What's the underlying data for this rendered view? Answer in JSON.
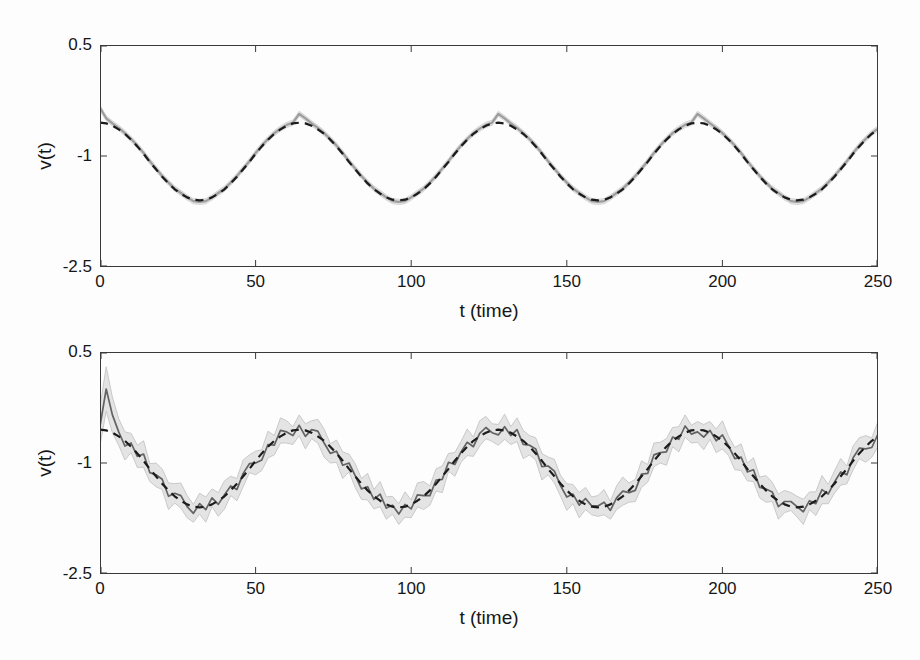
{
  "figure": {
    "background": "#fdfdfd",
    "axis_color": "#3a3a3a"
  },
  "chart_data": [
    {
      "type": "line",
      "name": "top-panel",
      "title": "",
      "xlabel": "t (time)",
      "ylabel": "v(t)",
      "xlim": [
        0,
        250
      ],
      "ylim": [
        -2.5,
        0.5
      ],
      "x_ticks": [
        0,
        50,
        100,
        150,
        200,
        250
      ],
      "x_tick_labels": [
        "0",
        "50",
        "100",
        "150",
        "200",
        "250"
      ],
      "y_ticks": [
        0.5,
        -1,
        -2.5
      ],
      "y_tick_labels": [
        "0.5",
        "-1",
        "-2.5"
      ],
      "grid": false,
      "legend": "none",
      "x_start": 0,
      "x_step": 2,
      "band": {
        "halfwidth": 0.035,
        "fill": "#e2e2e2",
        "edge": "#d6d6d6"
      },
      "series": [
        {
          "name": "filter_estimate",
          "role": "estimate",
          "style": "solid",
          "color": "#9d9d9d",
          "width": 2.2,
          "values": [
            -0.35,
            -0.49,
            -0.56,
            -0.62,
            -0.69,
            -0.77,
            -0.86,
            -0.96,
            -1.07,
            -1.17,
            -1.27,
            -1.36,
            -1.44,
            -1.5,
            -1.56,
            -1.61,
            -1.62,
            -1.61,
            -1.56,
            -1.5,
            -1.44,
            -1.36,
            -1.27,
            -1.17,
            -1.07,
            -0.96,
            -0.86,
            -0.77,
            -0.69,
            -0.63,
            -0.58,
            -0.55,
            -0.43,
            -0.49,
            -0.56,
            -0.62,
            -0.69,
            -0.77,
            -0.86,
            -0.96,
            -1.07,
            -1.17,
            -1.27,
            -1.36,
            -1.44,
            -1.5,
            -1.56,
            -1.61,
            -1.62,
            -1.61,
            -1.56,
            -1.5,
            -1.44,
            -1.36,
            -1.27,
            -1.17,
            -1.07,
            -0.96,
            -0.86,
            -0.77,
            -0.69,
            -0.63,
            -0.58,
            -0.55,
            -0.43,
            -0.49,
            -0.56,
            -0.62,
            -0.69,
            -0.77,
            -0.86,
            -0.96,
            -1.07,
            -1.17,
            -1.27,
            -1.36,
            -1.44,
            -1.5,
            -1.56,
            -1.61,
            -1.62,
            -1.61,
            -1.56,
            -1.5,
            -1.44,
            -1.36,
            -1.27,
            -1.17,
            -1.07,
            -0.96,
            -0.86,
            -0.77,
            -0.69,
            -0.63,
            -0.58,
            -0.55,
            -0.43,
            -0.49,
            -0.56,
            -0.62,
            -0.69,
            -0.77,
            -0.86,
            -0.96,
            -1.07,
            -1.17,
            -1.27,
            -1.36,
            -1.44,
            -1.5,
            -1.56,
            -1.61,
            -1.62,
            -1.61,
            -1.56,
            -1.5,
            -1.44,
            -1.36,
            -1.27,
            -1.17,
            -1.07,
            -0.96,
            -0.86,
            -0.77,
            -0.69,
            -0.63
          ]
        },
        {
          "name": "true_signal",
          "role": "truth",
          "style": "dashed",
          "color": "#1b1b1b",
          "width": 2.2,
          "dash": "8 6",
          "values": [
            -0.55,
            -0.56,
            -0.59,
            -0.64,
            -0.7,
            -0.78,
            -0.87,
            -0.97,
            -1.08,
            -1.18,
            -1.28,
            -1.37,
            -1.45,
            -1.51,
            -1.56,
            -1.59,
            -1.6,
            -1.59,
            -1.56,
            -1.51,
            -1.45,
            -1.37,
            -1.28,
            -1.18,
            -1.08,
            -0.97,
            -0.87,
            -0.78,
            -0.7,
            -0.64,
            -0.59,
            -0.56,
            -0.55,
            -0.56,
            -0.59,
            -0.64,
            -0.7,
            -0.78,
            -0.87,
            -0.97,
            -1.08,
            -1.18,
            -1.28,
            -1.37,
            -1.45,
            -1.51,
            -1.56,
            -1.59,
            -1.6,
            -1.59,
            -1.56,
            -1.51,
            -1.45,
            -1.37,
            -1.28,
            -1.18,
            -1.08,
            -0.97,
            -0.87,
            -0.78,
            -0.7,
            -0.64,
            -0.59,
            -0.56,
            -0.55,
            -0.56,
            -0.59,
            -0.64,
            -0.7,
            -0.78,
            -0.87,
            -0.97,
            -1.08,
            -1.18,
            -1.28,
            -1.37,
            -1.45,
            -1.51,
            -1.56,
            -1.59,
            -1.6,
            -1.59,
            -1.56,
            -1.51,
            -1.45,
            -1.37,
            -1.28,
            -1.18,
            -1.08,
            -0.97,
            -0.87,
            -0.78,
            -0.7,
            -0.64,
            -0.59,
            -0.56,
            -0.55,
            -0.56,
            -0.59,
            -0.64,
            -0.7,
            -0.78,
            -0.87,
            -0.97,
            -1.08,
            -1.18,
            -1.28,
            -1.37,
            -1.45,
            -1.51,
            -1.56,
            -1.59,
            -1.6,
            -1.59,
            -1.56,
            -1.51,
            -1.45,
            -1.37,
            -1.28,
            -1.18,
            -1.08,
            -0.97,
            -0.87,
            -0.78,
            -0.7,
            -0.64
          ]
        }
      ]
    },
    {
      "type": "line",
      "name": "bottom-panel",
      "title": "",
      "xlabel": "t (time)",
      "ylabel": "v(t)",
      "xlim": [
        0,
        250
      ],
      "ylim": [
        -2.5,
        0.5
      ],
      "x_ticks": [
        0,
        50,
        100,
        150,
        200,
        250
      ],
      "x_tick_labels": [
        "0",
        "50",
        "100",
        "150",
        "200",
        "250"
      ],
      "y_ticks": [
        0.5,
        -1,
        -2.5
      ],
      "y_tick_labels": [
        "0.5",
        "-1",
        "-2.5"
      ],
      "grid": false,
      "legend": "none",
      "x_start": 0,
      "x_step": 2,
      "band": {
        "fill": "#e4e4e4",
        "edge": "#c9c9c9",
        "halfwidth": [
          0.26,
          0.3,
          0.24,
          0.18,
          0.19,
          0.13,
          0.15,
          0.18,
          0.12,
          0.16,
          0.14,
          0.18,
          0.13,
          0.17,
          0.15,
          0.12,
          0.14,
          0.17,
          0.12,
          0.16,
          0.19,
          0.13,
          0.15,
          0.18,
          0.12,
          0.16,
          0.14,
          0.18,
          0.13,
          0.17,
          0.15,
          0.12,
          0.14,
          0.17,
          0.12,
          0.16,
          0.19,
          0.13,
          0.15,
          0.18,
          0.12,
          0.16,
          0.14,
          0.18,
          0.13,
          0.17,
          0.15,
          0.12,
          0.14,
          0.17,
          0.12,
          0.16,
          0.19,
          0.13,
          0.15,
          0.18,
          0.12,
          0.16,
          0.14,
          0.18,
          0.13,
          0.17,
          0.15,
          0.12,
          0.14,
          0.17,
          0.12,
          0.16,
          0.19,
          0.13,
          0.15,
          0.18,
          0.12,
          0.16,
          0.14,
          0.18,
          0.13,
          0.17,
          0.15,
          0.12,
          0.14,
          0.17,
          0.12,
          0.16,
          0.19,
          0.13,
          0.15,
          0.18,
          0.12,
          0.16,
          0.14,
          0.18,
          0.13,
          0.17,
          0.15,
          0.12,
          0.14,
          0.17,
          0.12,
          0.16,
          0.19,
          0.13,
          0.15,
          0.18,
          0.12,
          0.16,
          0.14,
          0.18,
          0.13,
          0.17,
          0.15,
          0.12,
          0.14,
          0.17,
          0.12,
          0.16,
          0.19,
          0.13,
          0.15,
          0.18,
          0.12,
          0.16,
          0.14,
          0.18,
          0.13,
          0.17
        ]
      },
      "series": [
        {
          "name": "filter_estimate",
          "role": "estimate",
          "style": "solid",
          "color": "#636363",
          "width": 1.7,
          "values": [
            -0.5,
            0,
            -0.35,
            -0.58,
            -0.77,
            -0.73,
            -0.91,
            -0.88,
            -1.13,
            -1.16,
            -1.22,
            -1.45,
            -1.41,
            -1.44,
            -1.59,
            -1.68,
            -1.55,
            -1.63,
            -1.47,
            -1.56,
            -1.43,
            -1.31,
            -1.36,
            -1.14,
            -1.01,
            -1,
            -0.96,
            -0.75,
            -0.76,
            -0.56,
            -0.58,
            -0.63,
            -0.49,
            -0.64,
            -0.55,
            -0.57,
            -0.73,
            -0.87,
            -0.84,
            -1.03,
            -1,
            -1.17,
            -1.35,
            -1.32,
            -1.49,
            -1.42,
            -1.61,
            -1.57,
            -1.69,
            -1.56,
            -1.62,
            -1.43,
            -1.44,
            -1.44,
            -1.23,
            -1.22,
            -0.99,
            -1.02,
            -0.85,
            -0.72,
            -0.78,
            -0.6,
            -0.52,
            -0.59,
            -0.62,
            -0.51,
            -0.63,
            -0.55,
            -0.75,
            -0.76,
            -0.81,
            -1.05,
            -1.04,
            -1.11,
            -1.31,
            -1.46,
            -1.42,
            -1.57,
            -1.48,
            -1.58,
            -1.58,
            -1.53,
            -1.64,
            -1.47,
            -1.38,
            -1.4,
            -1.37,
            -1.15,
            -1.14,
            -0.89,
            -0.86,
            -0.85,
            -0.65,
            -0.68,
            -0.5,
            -0.61,
            -0.58,
            -0.65,
            -0.56,
            -0.7,
            -0.62,
            -0.77,
            -0.94,
            -0.92,
            -1.12,
            -1.09,
            -1.33,
            -1.35,
            -1.39,
            -1.59,
            -1.52,
            -1.52,
            -1.59,
            -1.66,
            -1.51,
            -1.55,
            -1.36,
            -1.42,
            -1.26,
            -1.12,
            -1.16,
            -0.93,
            -0.8,
            -0.81,
            -0.79,
            -0.61
          ]
        },
        {
          "name": "true_signal",
          "role": "truth",
          "style": "dashed",
          "color": "#1b1b1b",
          "width": 2.2,
          "dash": "8 6",
          "values": [
            -0.55,
            -0.56,
            -0.59,
            -0.64,
            -0.7,
            -0.78,
            -0.87,
            -0.97,
            -1.08,
            -1.18,
            -1.28,
            -1.37,
            -1.45,
            -1.51,
            -1.56,
            -1.59,
            -1.6,
            -1.59,
            -1.56,
            -1.51,
            -1.45,
            -1.37,
            -1.28,
            -1.18,
            -1.08,
            -0.97,
            -0.87,
            -0.78,
            -0.7,
            -0.64,
            -0.59,
            -0.56,
            -0.55,
            -0.56,
            -0.59,
            -0.64,
            -0.7,
            -0.78,
            -0.87,
            -0.97,
            -1.08,
            -1.18,
            -1.28,
            -1.37,
            -1.45,
            -1.51,
            -1.56,
            -1.59,
            -1.6,
            -1.59,
            -1.56,
            -1.51,
            -1.45,
            -1.37,
            -1.28,
            -1.18,
            -1.08,
            -0.97,
            -0.87,
            -0.78,
            -0.7,
            -0.64,
            -0.59,
            -0.56,
            -0.55,
            -0.56,
            -0.59,
            -0.64,
            -0.7,
            -0.78,
            -0.87,
            -0.97,
            -1.08,
            -1.18,
            -1.28,
            -1.37,
            -1.45,
            -1.51,
            -1.56,
            -1.59,
            -1.6,
            -1.59,
            -1.56,
            -1.51,
            -1.45,
            -1.37,
            -1.28,
            -1.18,
            -1.08,
            -0.97,
            -0.87,
            -0.78,
            -0.7,
            -0.64,
            -0.59,
            -0.56,
            -0.55,
            -0.56,
            -0.59,
            -0.64,
            -0.7,
            -0.78,
            -0.87,
            -0.97,
            -1.08,
            -1.18,
            -1.28,
            -1.37,
            -1.45,
            -1.51,
            -1.56,
            -1.59,
            -1.6,
            -1.59,
            -1.56,
            -1.51,
            -1.45,
            -1.37,
            -1.28,
            -1.18,
            -1.08,
            -0.97,
            -0.87,
            -0.78,
            -0.7,
            -0.64
          ]
        }
      ]
    }
  ]
}
